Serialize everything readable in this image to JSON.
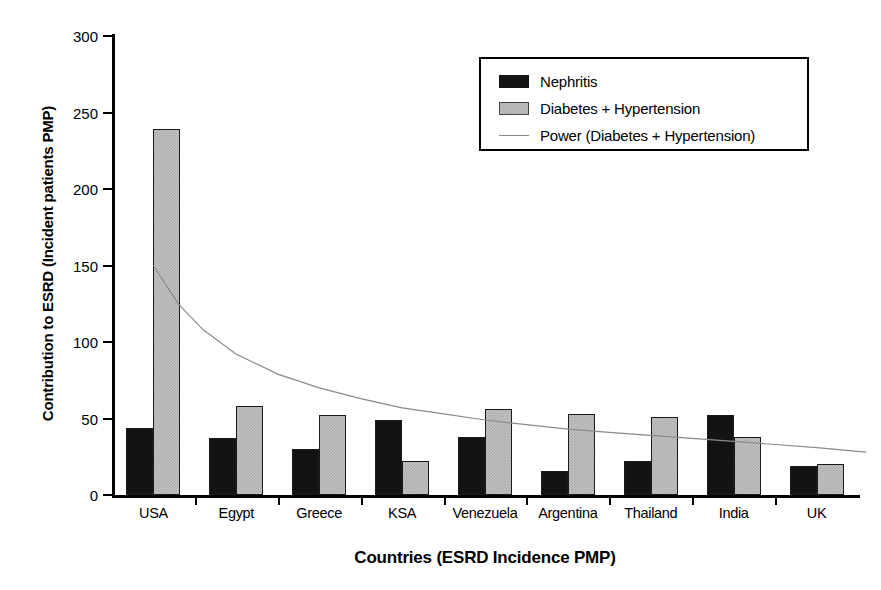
{
  "chart_data": {
    "type": "bar",
    "title": "",
    "xlabel": "Countries (ESRD Incidence PMP)",
    "ylabel": "Contribution to ESRD (Incident patients PMP)",
    "categories": [
      "USA",
      "Egypt",
      "Greece",
      "KSA",
      "Venezuela",
      "Argentina",
      "Thailand",
      "India",
      "UK"
    ],
    "series": [
      {
        "name": "Nephritis",
        "color": "#131313",
        "values": [
          44,
          37,
          30,
          49,
          38,
          16,
          22,
          52,
          19
        ]
      },
      {
        "name": "Diabetes + Hypertension",
        "color": "#c2c2c2",
        "values": [
          239,
          58,
          52,
          22,
          56,
          53,
          51,
          38,
          20
        ]
      }
    ],
    "trendline": {
      "name": "Power (Diabetes + Hypertension)",
      "color": "#8a8a8a",
      "style": "power",
      "points": [
        {
          "x": 0,
          "y": 150
        },
        {
          "x": 0.3,
          "y": 125
        },
        {
          "x": 0.6,
          "y": 108
        },
        {
          "x": 1,
          "y": 92
        },
        {
          "x": 1.5,
          "y": 79
        },
        {
          "x": 2,
          "y": 70
        },
        {
          "x": 2.5,
          "y": 63
        },
        {
          "x": 3,
          "y": 57
        },
        {
          "x": 3.5,
          "y": 53
        },
        {
          "x": 4,
          "y": 49
        },
        {
          "x": 4.5,
          "y": 46
        },
        {
          "x": 5,
          "y": 43
        },
        {
          "x": 5.5,
          "y": 41
        },
        {
          "x": 6,
          "y": 39
        },
        {
          "x": 6.5,
          "y": 37
        },
        {
          "x": 7,
          "y": 35
        },
        {
          "x": 7.5,
          "y": 33
        },
        {
          "x": 8,
          "y": 31
        },
        {
          "x": 8.6,
          "y": 28
        }
      ]
    },
    "yticks": [
      0,
      50,
      100,
      150,
      200,
      250,
      300
    ],
    "ylim": [
      0,
      300
    ],
    "grid": false,
    "legend_position": "top-right",
    "legend_entries": [
      "Nephritis",
      "Diabetes + Hypertension",
      "Power (Diabetes + Hypertension)"
    ]
  },
  "axis": {
    "y_title": "Contribution to ESRD (Incident patients PMP)",
    "x_title": "Countries (ESRD Incidence PMP)",
    "y_tick_labels": [
      "300",
      "250",
      "200",
      "150",
      "100",
      "50",
      "0"
    ]
  },
  "legend": {
    "items": [
      {
        "label": "Nephritis",
        "swatch": "black-square-icon"
      },
      {
        "label": "Diabetes + Hypertension",
        "swatch": "gray-square-icon"
      },
      {
        "label": "Power (Diabetes + Hypertension)",
        "swatch": "line-icon"
      }
    ]
  }
}
